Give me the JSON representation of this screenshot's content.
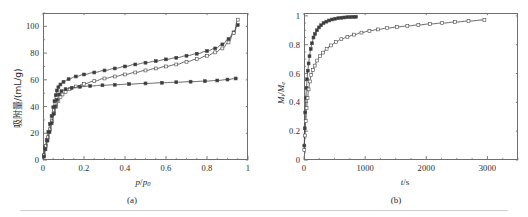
{
  "figure": {
    "background": "#ffffff",
    "axis_color": "#6f6f6f",
    "curve_color": "#4a4a4a",
    "marker_fill_closed": "#3a3a3a",
    "marker_fill_open": "#ffffff"
  },
  "panel_a": {
    "caption": "(a)",
    "xtitle_main": "p",
    "xtitle_sep": "/",
    "xtitle_sub_base": "p",
    "xtitle_sub": "0",
    "ytitle_cn": "吸附量/(mL/g)",
    "xticks": [
      "0",
      "0.2",
      "0.4",
      "0.6",
      "0.8",
      "1"
    ],
    "yticks": [
      "0",
      "20",
      "40",
      "60",
      "80",
      "100"
    ]
  },
  "panel_b": {
    "caption": "(b)",
    "xtitle_main": "t",
    "xtitle_unit": "/s",
    "ytitle_num": "M",
    "ytitle_num_sub": "t",
    "ytitle_den": "M",
    "ytitle_den_sub": "e",
    "xticks": [
      "0",
      "1000",
      "2000",
      "3000"
    ],
    "yticks": [
      "0",
      "0.2",
      "0.4",
      "0.6",
      "0.8",
      "1"
    ]
  },
  "chart_data": [
    {
      "type": "line",
      "panel": "a",
      "title": "",
      "xlabel": "p/p0",
      "ylabel": "吸附量/(mL/g)",
      "xlim": [
        0,
        1
      ],
      "ylim": [
        0,
        110
      ],
      "xticks": [
        0,
        0.2,
        0.4,
        0.6,
        0.8,
        1
      ],
      "yticks": [
        0,
        20,
        40,
        60,
        80,
        100
      ],
      "xminor_step": 0.05,
      "yminor_step": 10,
      "grid": false,
      "legend": "none",
      "series": [
        {
          "name": "sample-1-adsorption",
          "marker": "filled-square",
          "x": [
            0.004,
            0.01,
            0.018,
            0.026,
            0.034,
            0.042,
            0.05,
            0.056,
            0.062,
            0.068,
            0.075,
            0.085,
            0.1,
            0.125,
            0.16,
            0.2,
            0.25,
            0.3,
            0.35,
            0.4,
            0.45,
            0.5,
            0.55,
            0.6,
            0.65,
            0.7,
            0.75,
            0.8,
            0.84,
            0.875,
            0.905,
            0.93,
            0.95
          ],
          "y": [
            3.5,
            9.0,
            15.0,
            21.0,
            27.0,
            33.0,
            39.5,
            44.0,
            48.5,
            52.0,
            54.5,
            56.5,
            58.5,
            60.5,
            62.5,
            64.0,
            65.5,
            67.0,
            68.5,
            70.0,
            71.5,
            72.8,
            74.0,
            75.3,
            76.5,
            78.0,
            79.5,
            81.5,
            83.5,
            86.5,
            90.5,
            95.5,
            101.0
          ]
        },
        {
          "name": "sample-1-desorption",
          "marker": "open-square",
          "x": [
            0.95,
            0.93,
            0.905,
            0.875,
            0.84,
            0.8,
            0.75,
            0.7,
            0.65,
            0.6,
            0.55,
            0.5,
            0.45,
            0.4,
            0.35,
            0.3,
            0.25,
            0.2,
            0.16,
            0.13,
            0.11,
            0.095,
            0.085,
            0.075,
            0.065,
            0.055,
            0.045,
            0.035,
            0.025,
            0.015,
            0.006
          ],
          "y": [
            105.0,
            95.0,
            88.0,
            83.5,
            80.5,
            78.0,
            75.5,
            73.5,
            71.5,
            70.0,
            68.5,
            67.0,
            65.5,
            64.0,
            62.5,
            61.0,
            59.0,
            57.0,
            55.0,
            53.0,
            51.0,
            49.0,
            47.0,
            44.0,
            40.0,
            35.0,
            29.0,
            23.0,
            17.0,
            10.5,
            3.5
          ]
        },
        {
          "name": "sample-2-adsorption",
          "marker": "filled-square",
          "x": [
            0.004,
            0.012,
            0.022,
            0.032,
            0.042,
            0.052,
            0.06,
            0.068,
            0.078,
            0.09,
            0.11,
            0.14,
            0.18,
            0.23,
            0.29,
            0.35,
            0.42,
            0.5,
            0.58,
            0.65,
            0.72,
            0.79,
            0.85,
            0.9,
            0.94
          ],
          "y": [
            2.5,
            8.0,
            14.5,
            21.0,
            27.5,
            34.5,
            40.0,
            45.0,
            49.0,
            51.5,
            53.0,
            54.0,
            54.8,
            55.4,
            55.9,
            56.3,
            56.8,
            57.3,
            57.8,
            58.2,
            58.6,
            59.0,
            59.5,
            60.2,
            61.0
          ]
        }
      ]
    },
    {
      "type": "line",
      "panel": "b",
      "title": "",
      "xlabel": "t/s",
      "ylabel": "Mt/Me",
      "xlim": [
        0,
        3500
      ],
      "ylim": [
        0,
        1.02
      ],
      "xticks": [
        0,
        1000,
        2000,
        3000
      ],
      "yticks": [
        0,
        0.2,
        0.4,
        0.6,
        0.8,
        1
      ],
      "xminor_step": 250,
      "yminor_step": 0.05,
      "grid": false,
      "legend": "none",
      "series": [
        {
          "name": "fast-kinetics-curve",
          "marker": "filled-square",
          "x": [
            5,
            12,
            20,
            30,
            40,
            50,
            62,
            75,
            90,
            110,
            130,
            155,
            180,
            210,
            245,
            280,
            320,
            365,
            410,
            460,
            510,
            560,
            610,
            660,
            710,
            760,
            810,
            850
          ],
          "y": [
            0.1,
            0.22,
            0.33,
            0.43,
            0.5,
            0.56,
            0.62,
            0.67,
            0.72,
            0.77,
            0.81,
            0.85,
            0.875,
            0.9,
            0.92,
            0.935,
            0.95,
            0.96,
            0.968,
            0.975,
            0.98,
            0.984,
            0.987,
            0.989,
            0.991,
            0.992,
            0.993,
            0.994
          ]
        },
        {
          "name": "slow-kinetics-curve",
          "marker": "open-square",
          "x": [
            5,
            15,
            28,
            42,
            58,
            75,
            95,
            118,
            145,
            175,
            215,
            260,
            310,
            370,
            440,
            520,
            610,
            710,
            820,
            940,
            1070,
            1210,
            1360,
            1520,
            1690,
            1870,
            2060,
            2260,
            2470,
            2690,
            2950
          ],
          "y": [
            0.07,
            0.17,
            0.27,
            0.36,
            0.43,
            0.49,
            0.545,
            0.59,
            0.625,
            0.655,
            0.69,
            0.72,
            0.745,
            0.772,
            0.795,
            0.818,
            0.838,
            0.855,
            0.87,
            0.884,
            0.896,
            0.906,
            0.915,
            0.923,
            0.93,
            0.937,
            0.944,
            0.95,
            0.957,
            0.964,
            0.972
          ]
        }
      ]
    }
  ]
}
